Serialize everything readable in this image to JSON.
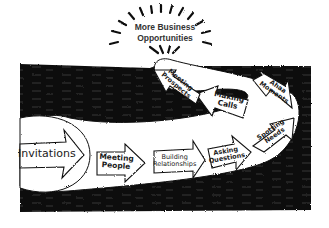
{
  "diagram": {
    "type": "process-flow",
    "style": "hand-drawn ink on white",
    "colors": {
      "ink": "#111111",
      "paper": "#ffffff",
      "text": "#1a1a1a"
    },
    "goal": {
      "line1": "More Business",
      "line2": "Opportunities"
    },
    "steps": [
      {
        "id": 1,
        "label": "Invitations"
      },
      {
        "id": 2,
        "line1": "Meeting",
        "line2": "People"
      },
      {
        "id": 3,
        "line1": "Building",
        "line2": "Relationships"
      },
      {
        "id": 4,
        "line1": "Asking",
        "line2": "Questions"
      },
      {
        "id": 5,
        "line1": "Spotting",
        "line2": "Needs"
      },
      {
        "id": 6,
        "line1": "Ahaa",
        "line2": "Moments"
      },
      {
        "id": 7,
        "line1": "Making",
        "line2": "Calls"
      },
      {
        "id": 8,
        "line1": "Meeting",
        "line2": "Prospects"
      }
    ]
  }
}
